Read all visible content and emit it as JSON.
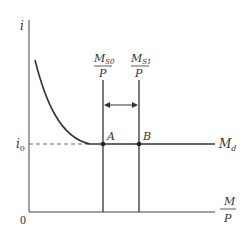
{
  "diagram": {
    "type": "liquidity-trap",
    "y_axis_label": "i",
    "x_axis_label_num": "M",
    "x_axis_label_den": "P",
    "origin_label": "0",
    "i0_label": "i",
    "i0_subscript": "0",
    "curve_label": "M",
    "curve_subscript": "d",
    "supply0_num": "M",
    "supply0_sub": "S0",
    "supply0_den": "P",
    "supply1_num": "M",
    "supply1_sub": "S1",
    "supply1_den": "P",
    "point_a": "A",
    "point_b": "B"
  },
  "colors": {
    "line": "#333333",
    "dashed": "#555555"
  }
}
